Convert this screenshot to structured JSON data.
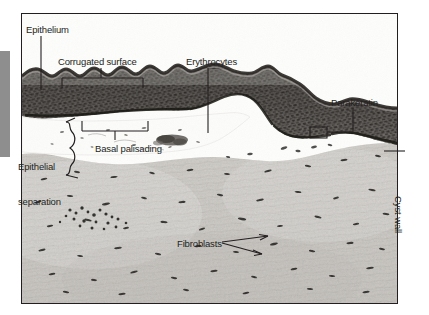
{
  "figure": {
    "type": "histology-micrograph-annotated",
    "frame": {
      "stroke_color": "#231f20"
    },
    "margin_bar": {
      "color": "#8e8e8e"
    }
  },
  "annotations": {
    "epithelium": {
      "label": "Epithelium",
      "kind": "leader-line",
      "x": 26,
      "y": 24
    },
    "corrugated_surface": {
      "label": "Corrugated surface",
      "kind": "bracket-up",
      "x": 58,
      "y": 56
    },
    "erythrocytes": {
      "label": "Erythrocytes",
      "kind": "leader-line",
      "x": 186,
      "y": 56
    },
    "parakeratin": {
      "label": "Parakeratin",
      "kind": "box-callout",
      "x": 331,
      "y": 97
    },
    "basal_palisading": {
      "label": "Basal palisading",
      "kind": "bracket-down",
      "x": 95,
      "y": 143
    },
    "epithelial_separation": {
      "label": "Epithelial\nseparation",
      "label_line1": "Epithelial",
      "label_line2": "separation",
      "kind": "curly-brace",
      "x": 22,
      "y": 140
    },
    "fibroblasts": {
      "label": "Fibroblasts",
      "kind": "double-arrow",
      "x": 177,
      "y": 238
    },
    "cyst_wall": {
      "label": "Cyst wall",
      "kind": "rotated-label",
      "rotation_deg": 90,
      "x": 404,
      "y": 196
    }
  },
  "colors": {
    "ink": "#231f20",
    "margin_gray": "#8e8e8e",
    "tissue_light": "#d8d6d2",
    "tissue_mid": "#c9c6c1",
    "epithelium_dark": "#3a3734",
    "lumen_white": "#fdfdfc"
  }
}
